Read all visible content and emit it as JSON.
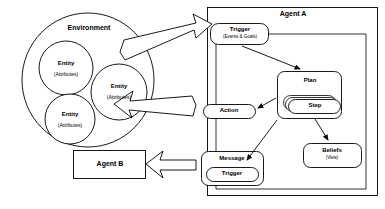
{
  "diagram": {
    "style": {
      "stroke": "#000000",
      "fill": "#ffffff",
      "background": "#ffffff"
    },
    "environment": {
      "label": "Environment",
      "entities": [
        {
          "name": "Entity",
          "sub": "(Attributes)"
        },
        {
          "name": "Entity",
          "sub": "(Attributes)"
        },
        {
          "name": "Entity",
          "sub": "(Attributes)"
        }
      ]
    },
    "agent_a": {
      "label": "Agent A",
      "nodes": {
        "trigger": {
          "label": "Trigger",
          "sub": "(Events & Goals)"
        },
        "plan": {
          "label": "Plan",
          "step": "Step"
        },
        "action": {
          "label": "Action"
        },
        "message": {
          "label": "Message",
          "trigger": "Trigger"
        },
        "beliefs": {
          "label": "Beliefs",
          "sub": "(View)"
        }
      }
    },
    "agent_b": {
      "label": "Agent B"
    },
    "connectors": [
      {
        "name": "environment-to-trigger",
        "style": "hollow-block-arrow",
        "direction": "right"
      },
      {
        "name": "action-to-environment",
        "style": "hollow-block-arrow",
        "direction": "left"
      },
      {
        "name": "message-to-agent-b",
        "style": "hollow-block-arrow",
        "direction": "left"
      },
      {
        "name": "trigger-to-plan",
        "style": "solid-line-arrow"
      },
      {
        "name": "plan-to-action",
        "style": "solid-line-arrow"
      },
      {
        "name": "plan-to-message",
        "style": "solid-line-arrow"
      },
      {
        "name": "plan-to-beliefs",
        "style": "solid-line-arrow"
      },
      {
        "name": "message-feedback-to-trigger",
        "style": "solid-line-arrow"
      }
    ]
  }
}
